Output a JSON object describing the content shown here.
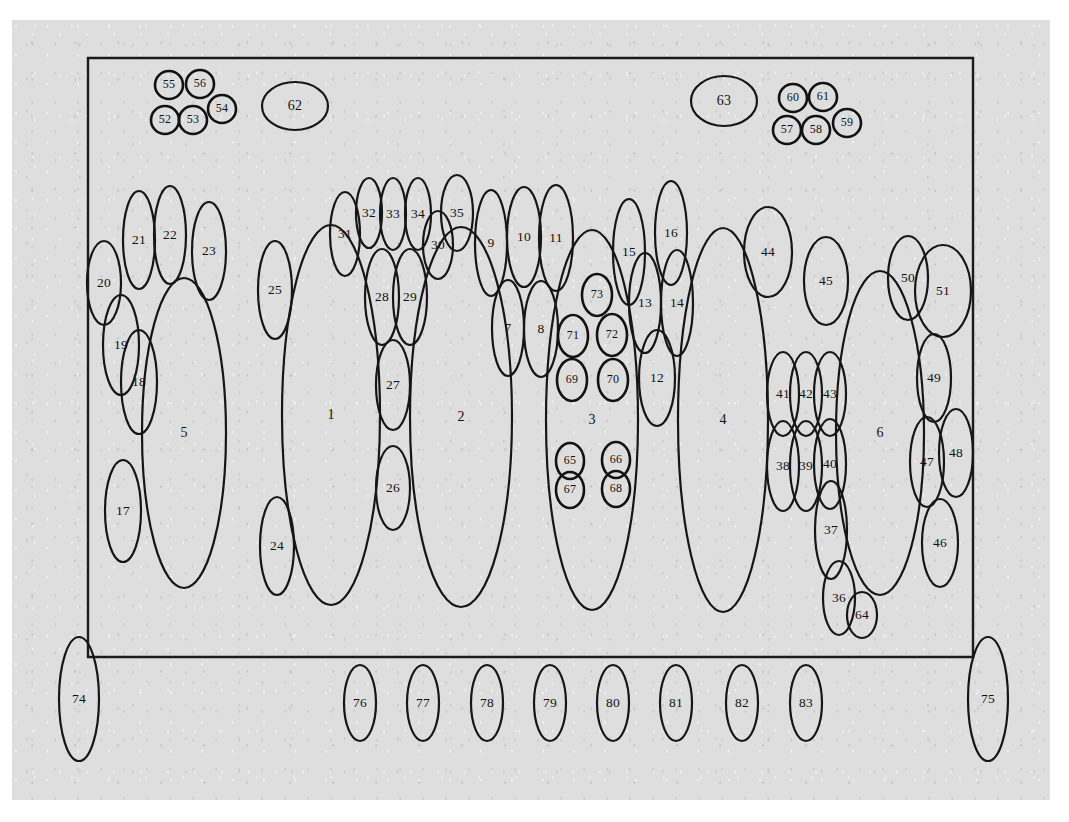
{
  "figure": {
    "kind": "numbered-ellipse-layout-diagram",
    "background_color": "#dedede",
    "ink_color": "#161616",
    "page_color": "#ffffff",
    "frame": {
      "x": 88,
      "y": 58,
      "width": 885,
      "height": 599
    }
  },
  "chart_data": {
    "type": "scatter",
    "title": "",
    "xlabel": "",
    "ylabel": "",
    "legend": [],
    "grid": false,
    "xlim": [
      0,
      1069
    ],
    "ylim": [
      0,
      822
    ],
    "note": "Each datum is a labelled ellipse (outline only) placed on a gray scanned sheet inside a rectangular frame.",
    "frame_rect": {
      "x": 88,
      "y": 58,
      "w": 885,
      "h": 599
    },
    "ellipses": [
      {
        "label": "1",
        "cx": 331,
        "cy": 415,
        "rx": 49,
        "ry": 190,
        "rot": 0,
        "size": "large"
      },
      {
        "label": "2",
        "cx": 461,
        "cy": 417,
        "rx": 51,
        "ry": 190,
        "rot": 0,
        "size": "large"
      },
      {
        "label": "3",
        "cx": 592,
        "cy": 420,
        "rx": 46,
        "ry": 190,
        "rot": 0,
        "size": "large"
      },
      {
        "label": "4",
        "cx": 723,
        "cy": 420,
        "rx": 45,
        "ry": 192,
        "rot": 0,
        "size": "large"
      },
      {
        "label": "5",
        "cx": 184,
        "cy": 433,
        "rx": 42,
        "ry": 155,
        "rot": 0,
        "size": "large"
      },
      {
        "label": "6",
        "cx": 880,
        "cy": 433,
        "rx": 44,
        "ry": 162,
        "rot": 0,
        "size": "large"
      },
      {
        "label": "7",
        "cx": 508,
        "cy": 328,
        "rx": 16,
        "ry": 48,
        "rot": 0,
        "size": "medium"
      },
      {
        "label": "8",
        "cx": 541,
        "cy": 329,
        "rx": 17,
        "ry": 48,
        "rot": 0,
        "size": "medium"
      },
      {
        "label": "9",
        "cx": 491,
        "cy": 243,
        "rx": 16,
        "ry": 53,
        "rot": 0,
        "size": "medium"
      },
      {
        "label": "10",
        "cx": 524,
        "cy": 237,
        "rx": 17,
        "ry": 50,
        "rot": 0,
        "size": "medium"
      },
      {
        "label": "11",
        "cx": 556,
        "cy": 238,
        "rx": 17,
        "ry": 53,
        "rot": 0,
        "size": "medium"
      },
      {
        "label": "12",
        "cx": 657,
        "cy": 378,
        "rx": 18,
        "ry": 48,
        "rot": 0,
        "size": "medium"
      },
      {
        "label": "13",
        "cx": 645,
        "cy": 303,
        "rx": 16,
        "ry": 50,
        "rot": 0,
        "size": "medium"
      },
      {
        "label": "14",
        "cx": 677,
        "cy": 303,
        "rx": 16,
        "ry": 53,
        "rot": 0,
        "size": "medium"
      },
      {
        "label": "15",
        "cx": 629,
        "cy": 252,
        "rx": 16,
        "ry": 53,
        "rot": 0,
        "size": "medium"
      },
      {
        "label": "16",
        "cx": 671,
        "cy": 233,
        "rx": 16,
        "ry": 52,
        "rot": 0,
        "size": "medium"
      },
      {
        "label": "17",
        "cx": 123,
        "cy": 511,
        "rx": 18,
        "ry": 51,
        "rot": 0,
        "size": "medium"
      },
      {
        "label": "18",
        "cx": 139,
        "cy": 382,
        "rx": 18,
        "ry": 52,
        "rot": 0,
        "size": "medium"
      },
      {
        "label": "19",
        "cx": 121,
        "cy": 345,
        "rx": 18,
        "ry": 50,
        "rot": 0,
        "size": "medium"
      },
      {
        "label": "20",
        "cx": 104,
        "cy": 283,
        "rx": 17,
        "ry": 42,
        "rot": 0,
        "size": "medium"
      },
      {
        "label": "21",
        "cx": 139,
        "cy": 240,
        "rx": 16,
        "ry": 49,
        "rot": 0,
        "size": "medium"
      },
      {
        "label": "22",
        "cx": 170,
        "cy": 235,
        "rx": 16,
        "ry": 49,
        "rot": 0,
        "size": "medium"
      },
      {
        "label": "23",
        "cx": 209,
        "cy": 251,
        "rx": 17,
        "ry": 49,
        "rot": 0,
        "size": "medium"
      },
      {
        "label": "24",
        "cx": 277,
        "cy": 546,
        "rx": 17,
        "ry": 49,
        "rot": 0,
        "size": "medium"
      },
      {
        "label": "25",
        "cx": 275,
        "cy": 290,
        "rx": 17,
        "ry": 49,
        "rot": 0,
        "size": "medium"
      },
      {
        "label": "26",
        "cx": 393,
        "cy": 488,
        "rx": 17,
        "ry": 42,
        "rot": 0,
        "size": "medium"
      },
      {
        "label": "27",
        "cx": 393,
        "cy": 385,
        "rx": 17,
        "ry": 45,
        "rot": 0,
        "size": "medium"
      },
      {
        "label": "28",
        "cx": 382,
        "cy": 297,
        "rx": 17,
        "ry": 48,
        "rot": 0,
        "size": "medium"
      },
      {
        "label": "29",
        "cx": 410,
        "cy": 297,
        "rx": 17,
        "ry": 48,
        "rot": 0,
        "size": "medium"
      },
      {
        "label": "30",
        "cx": 438,
        "cy": 245,
        "rx": 15,
        "ry": 34,
        "rot": 0,
        "size": "medium"
      },
      {
        "label": "31",
        "cx": 345,
        "cy": 234,
        "rx": 15,
        "ry": 42,
        "rot": 0,
        "size": "medium"
      },
      {
        "label": "32",
        "cx": 369,
        "cy": 213,
        "rx": 13,
        "ry": 35,
        "rot": 0,
        "size": "medium"
      },
      {
        "label": "33",
        "cx": 393,
        "cy": 214,
        "rx": 13,
        "ry": 36,
        "rot": 0,
        "size": "medium"
      },
      {
        "label": "34",
        "cx": 418,
        "cy": 214,
        "rx": 13,
        "ry": 36,
        "rot": 0,
        "size": "medium"
      },
      {
        "label": "35",
        "cx": 457,
        "cy": 213,
        "rx": 16,
        "ry": 38,
        "rot": 0,
        "size": "medium"
      },
      {
        "label": "36",
        "cx": 839,
        "cy": 598,
        "rx": 16,
        "ry": 37,
        "rot": 0,
        "size": "medium"
      },
      {
        "label": "37",
        "cx": 831,
        "cy": 530,
        "rx": 16,
        "ry": 49,
        "rot": 0,
        "size": "medium"
      },
      {
        "label": "38",
        "cx": 783,
        "cy": 466,
        "rx": 16,
        "ry": 45,
        "rot": 0,
        "size": "medium"
      },
      {
        "label": "39",
        "cx": 806,
        "cy": 466,
        "rx": 16,
        "ry": 45,
        "rot": 0,
        "size": "medium"
      },
      {
        "label": "40",
        "cx": 830,
        "cy": 464,
        "rx": 16,
        "ry": 45,
        "rot": 0,
        "size": "medium"
      },
      {
        "label": "41",
        "cx": 783,
        "cy": 394,
        "rx": 16,
        "ry": 42,
        "rot": 0,
        "size": "medium"
      },
      {
        "label": "42",
        "cx": 806,
        "cy": 394,
        "rx": 16,
        "ry": 42,
        "rot": 0,
        "size": "medium"
      },
      {
        "label": "43",
        "cx": 830,
        "cy": 394,
        "rx": 16,
        "ry": 42,
        "rot": 0,
        "size": "medium"
      },
      {
        "label": "44",
        "cx": 768,
        "cy": 252,
        "rx": 24,
        "ry": 45,
        "rot": 0,
        "size": "medium"
      },
      {
        "label": "45",
        "cx": 826,
        "cy": 281,
        "rx": 22,
        "ry": 44,
        "rot": 0,
        "size": "medium"
      },
      {
        "label": "46",
        "cx": 940,
        "cy": 543,
        "rx": 18,
        "ry": 44,
        "rot": 0,
        "size": "medium"
      },
      {
        "label": "47",
        "cx": 927,
        "cy": 462,
        "rx": 17,
        "ry": 45,
        "rot": 0,
        "size": "medium"
      },
      {
        "label": "48",
        "cx": 956,
        "cy": 453,
        "rx": 17,
        "ry": 44,
        "rot": 0,
        "size": "medium"
      },
      {
        "label": "49",
        "cx": 934,
        "cy": 378,
        "rx": 17,
        "ry": 44,
        "rot": 0,
        "size": "medium"
      },
      {
        "label": "50",
        "cx": 908,
        "cy": 278,
        "rx": 20,
        "ry": 42,
        "rot": 0,
        "size": "medium"
      },
      {
        "label": "51",
        "cx": 943,
        "cy": 291,
        "rx": 28,
        "ry": 46,
        "rot": 0,
        "size": "medium"
      },
      {
        "label": "52",
        "cx": 165,
        "cy": 120,
        "rx": 14,
        "ry": 14,
        "rot": 0,
        "size": "circle"
      },
      {
        "label": "53",
        "cx": 193,
        "cy": 120,
        "rx": 14,
        "ry": 14,
        "rot": 0,
        "size": "circle"
      },
      {
        "label": "54",
        "cx": 222,
        "cy": 109,
        "rx": 14,
        "ry": 14,
        "rot": 0,
        "size": "circle"
      },
      {
        "label": "55",
        "cx": 169,
        "cy": 85,
        "rx": 14,
        "ry": 14,
        "rot": 0,
        "size": "circle"
      },
      {
        "label": "56",
        "cx": 200,
        "cy": 84,
        "rx": 14,
        "ry": 14,
        "rot": 0,
        "size": "circle"
      },
      {
        "label": "57",
        "cx": 787,
        "cy": 130,
        "rx": 14,
        "ry": 14,
        "rot": 0,
        "size": "circle"
      },
      {
        "label": "58",
        "cx": 816,
        "cy": 130,
        "rx": 14,
        "ry": 14,
        "rot": 0,
        "size": "circle"
      },
      {
        "label": "59",
        "cx": 847,
        "cy": 123,
        "rx": 14,
        "ry": 14,
        "rot": 0,
        "size": "circle"
      },
      {
        "label": "60",
        "cx": 793,
        "cy": 98,
        "rx": 14,
        "ry": 14,
        "rot": 0,
        "size": "circle"
      },
      {
        "label": "61",
        "cx": 823,
        "cy": 97,
        "rx": 14,
        "ry": 14,
        "rot": 0,
        "size": "circle"
      },
      {
        "label": "62",
        "cx": 295,
        "cy": 106,
        "rx": 33,
        "ry": 24,
        "rot": 0,
        "size": "oval"
      },
      {
        "label": "63",
        "cx": 724,
        "cy": 101,
        "rx": 33,
        "ry": 25,
        "rot": 0,
        "size": "oval"
      },
      {
        "label": "64",
        "cx": 862,
        "cy": 615,
        "rx": 15,
        "ry": 23,
        "rot": 0,
        "size": "medium"
      },
      {
        "label": "65",
        "cx": 570,
        "cy": 461,
        "rx": 14,
        "ry": 18,
        "rot": 0,
        "size": "small"
      },
      {
        "label": "66",
        "cx": 616,
        "cy": 460,
        "rx": 14,
        "ry": 18,
        "rot": 0,
        "size": "small"
      },
      {
        "label": "67",
        "cx": 570,
        "cy": 490,
        "rx": 14,
        "ry": 18,
        "rot": 0,
        "size": "small"
      },
      {
        "label": "68",
        "cx": 616,
        "cy": 489,
        "rx": 14,
        "ry": 18,
        "rot": 0,
        "size": "small"
      },
      {
        "label": "69",
        "cx": 572,
        "cy": 380,
        "rx": 15,
        "ry": 21,
        "rot": 0,
        "size": "small"
      },
      {
        "label": "70",
        "cx": 613,
        "cy": 380,
        "rx": 15,
        "ry": 21,
        "rot": 0,
        "size": "small"
      },
      {
        "label": "71",
        "cx": 573,
        "cy": 336,
        "rx": 15,
        "ry": 21,
        "rot": 0,
        "size": "small"
      },
      {
        "label": "72",
        "cx": 612,
        "cy": 335,
        "rx": 15,
        "ry": 21,
        "rot": 0,
        "size": "small"
      },
      {
        "label": "73",
        "cx": 597,
        "cy": 295,
        "rx": 15,
        "ry": 21,
        "rot": 0,
        "size": "small"
      },
      {
        "label": "74",
        "cx": 79,
        "cy": 699,
        "rx": 20,
        "ry": 62,
        "rot": 0,
        "size": "medium"
      },
      {
        "label": "75",
        "cx": 988,
        "cy": 699,
        "rx": 20,
        "ry": 62,
        "rot": 0,
        "size": "medium"
      },
      {
        "label": "76",
        "cx": 360,
        "cy": 703,
        "rx": 16,
        "ry": 38,
        "rot": 0,
        "size": "medium"
      },
      {
        "label": "77",
        "cx": 423,
        "cy": 703,
        "rx": 16,
        "ry": 38,
        "rot": 0,
        "size": "medium"
      },
      {
        "label": "78",
        "cx": 487,
        "cy": 703,
        "rx": 16,
        "ry": 38,
        "rot": 0,
        "size": "medium"
      },
      {
        "label": "79",
        "cx": 550,
        "cy": 703,
        "rx": 16,
        "ry": 38,
        "rot": 0,
        "size": "medium"
      },
      {
        "label": "80",
        "cx": 613,
        "cy": 703,
        "rx": 16,
        "ry": 38,
        "rot": 0,
        "size": "medium"
      },
      {
        "label": "81",
        "cx": 676,
        "cy": 703,
        "rx": 16,
        "ry": 38,
        "rot": 0,
        "size": "medium"
      },
      {
        "label": "82",
        "cx": 742,
        "cy": 703,
        "rx": 16,
        "ry": 38,
        "rot": 0,
        "size": "medium"
      },
      {
        "label": "83",
        "cx": 806,
        "cy": 703,
        "rx": 16,
        "ry": 38,
        "rot": 0,
        "size": "medium"
      }
    ]
  }
}
